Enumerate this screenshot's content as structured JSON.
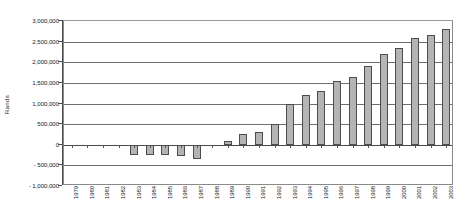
{
  "chart_data": {
    "type": "bar",
    "title": "",
    "subtitle": "",
    "xlabel": "",
    "ylabel": "Rands",
    "ylim": [
      -1000000,
      3000000
    ],
    "grid": true,
    "legend": false,
    "legend_position": "none",
    "y_ticks": [
      3000000,
      2500000,
      2000000,
      1500000,
      1000000,
      500000,
      0,
      -500000,
      -1000000
    ],
    "y_tick_labels": [
      "3,000,000",
      "2,500,000",
      "2,000,000",
      "1,500,000",
      "1,000,000",
      "500,000",
      "0",
      "- 500,000",
      "- 1,000,000"
    ],
    "categories": [
      "1979",
      "1980",
      "1981",
      "1982",
      "1983",
      "1984",
      "1985",
      "1986",
      "1987",
      "1988",
      "1989",
      "1990",
      "1991",
      "1992",
      "1993",
      "1994",
      "1995",
      "1996",
      "1997",
      "1998",
      "1999",
      "2000",
      "2001",
      "2002",
      "2003"
    ],
    "values": [
      0,
      0,
      0,
      0,
      -250000,
      -250000,
      -250000,
      -270000,
      -350000,
      0,
      100000,
      250000,
      300000,
      500000,
      1000000,
      1200000,
      1300000,
      1550000,
      1650000,
      1900000,
      2200000,
      2350000,
      2600000,
      2650000,
      2800000
    ],
    "series_name": "Rands",
    "bar_fill_color": "#b4b4b4",
    "bar_border_color": "#4d4d4d",
    "plot_border_color": "#8a8a8a",
    "gridline_color": "#6f6f6f",
    "background_color": "#ffffff"
  }
}
